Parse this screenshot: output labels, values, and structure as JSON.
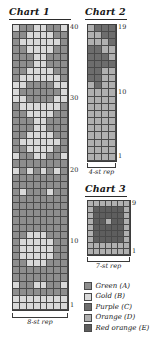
{
  "palette": {
    "A": "#8e8e8e",
    "B": "#d9d9d9",
    "C": "#6d6d6d",
    "D": "#b0b0b0",
    "E": "#5e5e5e"
  },
  "charts": [
    {
      "id": "chart-1",
      "title": "Chart 1",
      "columns": 8,
      "rows": 40,
      "repeat_label": "8-st rep",
      "row_labels": [
        "40",
        "30",
        "20",
        "10",
        "1"
      ],
      "row_label_rows": [
        40,
        30,
        20,
        10,
        1
      ],
      "grid": [
        "BAABBAAB",
        "AABBBBAA",
        "ABBBBBBA",
        "AABBBBAA",
        "AAABBAAA",
        "AAABBAAA",
        "AABBBBAA",
        "ABBBBBBA",
        "BBAAAABB",
        "BAAAAAAB",
        "BBAAAABB",
        "ABBBBBBA",
        "AABBBBAA",
        "AAABBAAA",
        "AAABBAAA",
        "AABBBBAA",
        "ABBBBBBA",
        "AABBBBAA",
        "BAABBAAB",
        "AAAAAAAA",
        "BABABABA",
        "AAAAAAAA",
        "AAAAAAAA",
        "ABAAABAA",
        "AAAAAAAA",
        "AAAAAAAA",
        "AAAAAAAA",
        "AAAAAAAA",
        "AAAAAAAA",
        "AABBBAAA",
        "ABBBBBAA",
        "ABBBBBAA",
        "ABBBBBAA",
        "AABBBAAA",
        "AAAAAAAA",
        "AAAAAAAA",
        "BAABBAAB",
        "AAAAAAAA",
        "BBBBBBBB",
        "BBBBBBBB"
      ]
    },
    {
      "id": "chart-2",
      "title": "Chart 2",
      "columns": 4,
      "rows": 19,
      "repeat_label": "4-st rep",
      "row_labels": [
        "19",
        "10",
        "1"
      ],
      "row_label_rows": [
        19,
        10,
        1
      ],
      "grid": [
        "DCCC",
        "DDCC",
        "DDDC",
        "CCDD",
        "CCCD",
        "CCCC",
        "CCDD",
        "CCDD",
        "DCDD",
        "DDDD",
        "DDDD",
        "DDDD",
        "DDDD",
        "DDDD",
        "DDDD",
        "DDDD",
        "DDDD",
        "DDDD",
        "DDDD"
      ]
    },
    {
      "id": "chart-3",
      "title": "Chart 3",
      "columns": 7,
      "rows": 9,
      "repeat_label": "7-st rep",
      "row_labels": [
        "9",
        "1"
      ],
      "row_label_rows": [
        9,
        1
      ],
      "grid": [
        "DDDDDDD",
        "DEEEEED",
        "DEEEEED",
        "DEEDEED",
        "DEEEEED",
        "DEEEEED",
        "DEEEEED",
        "DDDDDDD",
        "DDDDDDD"
      ]
    }
  ],
  "legend": {
    "items": [
      {
        "key": "A",
        "label": "Green (A)"
      },
      {
        "key": "B",
        "label": "Gold (B)"
      },
      {
        "key": "C",
        "label": "Purple (C)"
      },
      {
        "key": "D",
        "label": "Orange (D)"
      },
      {
        "key": "E",
        "label": "Red orange (E)"
      }
    ]
  }
}
